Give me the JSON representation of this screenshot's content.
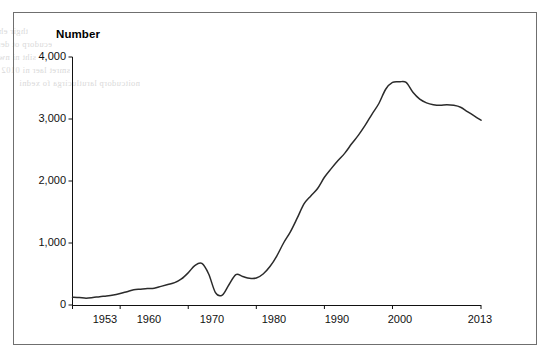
{
  "figure": {
    "frame_border_color": "#6f6f6f",
    "background_color": "#ffffff",
    "line_color": "#2b2b2b",
    "axis_color": "#111111"
  },
  "axis_title": "Number",
  "bleed_lines": [
    "thgir eht ot stfihs evruc dnamed eht ,esaercni semocni sA",
    "ecudorp ot derapmi era srecudorp nehw tfel eht ot stfihs",
    "siht ni nwohs sa ,tuptuo fo level emas eht ecirp nevig a ta",
    "smret laer ni 0102 ot 0591 morf elpmaxe na sedivorp hcihw",
    "noitcudorp larutlucirga fo xedni"
  ],
  "chart_data": {
    "type": "line",
    "title": "",
    "xlabel": "",
    "ylabel": "Number",
    "xlim": [
      1953,
      2013
    ],
    "ylim": [
      0,
      4000
    ],
    "grid": false,
    "legend": null,
    "y_ticks": [
      0,
      1000,
      2000,
      3000,
      4000
    ],
    "y_tick_labels": [
      "0",
      "1,000",
      "2,000",
      "3,000",
      "4,000"
    ],
    "x_ticks": [
      1953,
      1960,
      1970,
      1980,
      1990,
      2000,
      2013
    ],
    "x_tick_labels": [
      "1953",
      "1960",
      "1970",
      "1980",
      "1990",
      "2000",
      "2013"
    ],
    "series": [
      {
        "name": "Number",
        "x": [
          1953,
          1954,
          1955,
          1956,
          1957,
          1958,
          1959,
          1960,
          1961,
          1962,
          1963,
          1964,
          1965,
          1966,
          1967,
          1968,
          1969,
          1970,
          1971,
          1972,
          1973,
          1974,
          1975,
          1976,
          1977,
          1978,
          1979,
          1980,
          1981,
          1982,
          1983,
          1984,
          1985,
          1986,
          1987,
          1988,
          1989,
          1990,
          1991,
          1992,
          1993,
          1994,
          1995,
          1996,
          1997,
          1998,
          1999,
          2000,
          2001,
          2002,
          2003,
          2004,
          2005,
          2006,
          2007,
          2008,
          2009,
          2010,
          2011,
          2012,
          2013
        ],
        "values": [
          125,
          120,
          110,
          120,
          135,
          145,
          160,
          185,
          215,
          245,
          255,
          265,
          270,
          300,
          330,
          360,
          420,
          520,
          640,
          670,
          500,
          200,
          160,
          330,
          490,
          460,
          430,
          435,
          500,
          620,
          790,
          1000,
          1180,
          1400,
          1630,
          1760,
          1880,
          2060,
          2200,
          2330,
          2450,
          2600,
          2740,
          2900,
          3080,
          3250,
          3480,
          3590,
          3600,
          3590,
          3430,
          3320,
          3260,
          3230,
          3220,
          3230,
          3220,
          3190,
          3120,
          3050,
          2980
        ]
      }
    ]
  }
}
